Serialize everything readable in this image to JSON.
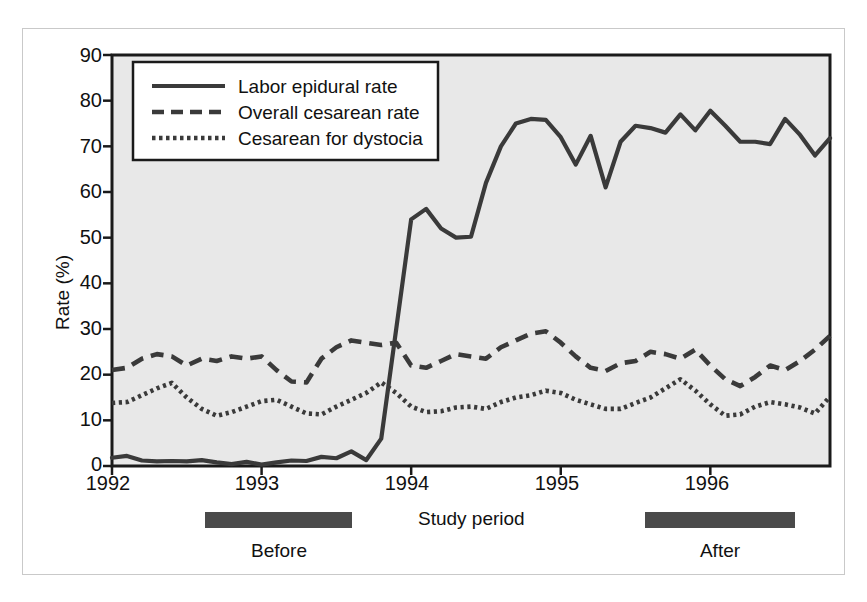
{
  "figure": {
    "background": "#ffffff",
    "plot_background": "#e8e8e8",
    "frame_color": "#c9c9c9",
    "ink_color": "#3a3a3a"
  },
  "chart_data": {
    "type": "line",
    "title": "",
    "xlabel": "Study period",
    "ylabel": "Rate (%)",
    "ylim": [
      0,
      90
    ],
    "yticks": [
      0,
      10,
      20,
      30,
      40,
      50,
      60,
      70,
      80,
      90
    ],
    "xlim": [
      1992.0,
      1996.8
    ],
    "xticks": [
      1992,
      1993,
      1994,
      1995,
      1996
    ],
    "xtick_labels": [
      "1992",
      "1993",
      "1994",
      "1995",
      "1996"
    ],
    "grid": false,
    "legend_position": "top-left inside",
    "x": [
      1992.0,
      1992.1,
      1992.2,
      1992.3,
      1992.4,
      1992.5,
      1992.6,
      1992.7,
      1992.8,
      1992.9,
      1993.0,
      1993.1,
      1993.2,
      1993.3,
      1993.4,
      1993.5,
      1993.6,
      1993.7,
      1993.8,
      1993.9,
      1994.0,
      1994.1,
      1994.2,
      1994.3,
      1994.4,
      1994.5,
      1994.6,
      1994.7,
      1994.8,
      1994.9,
      1995.0,
      1995.1,
      1995.2,
      1995.3,
      1995.4,
      1995.5,
      1995.6,
      1995.7,
      1995.8,
      1995.9,
      1996.0,
      1996.1,
      1996.2,
      1996.3,
      1996.4,
      1996.5,
      1996.6,
      1996.7,
      1996.8
    ],
    "series": [
      {
        "name": "Labor epidural rate",
        "style": "solid",
        "values": [
          1.8,
          2.2,
          1.2,
          1.0,
          1.1,
          1.0,
          1.3,
          0.8,
          0.4,
          0.9,
          0.3,
          0.8,
          1.2,
          1.1,
          2.0,
          1.7,
          3.2,
          1.3,
          6.0,
          30.0,
          54.0,
          56.3,
          52.0,
          50.0,
          50.2,
          62.0,
          70.0,
          75.0,
          76.0,
          75.8,
          72.0,
          66.0,
          72.3,
          61.0,
          71.0,
          74.5,
          74.0,
          73.0,
          77.0,
          73.5,
          77.8,
          74.5,
          71.0,
          71.0,
          70.5,
          76.0,
          72.5,
          68.0,
          71.8
        ]
      },
      {
        "name": "Overall cesarean rate",
        "style": "dashed",
        "values": [
          21.0,
          21.5,
          23.5,
          24.5,
          24.0,
          22.0,
          23.5,
          23.0,
          24.0,
          23.5,
          24.0,
          21.0,
          18.5,
          18.3,
          23.5,
          26.0,
          27.5,
          27.0,
          26.5,
          27.0,
          22.0,
          21.5,
          23.0,
          24.5,
          24.0,
          23.5,
          26.0,
          27.5,
          29.0,
          29.5,
          27.0,
          24.0,
          21.5,
          20.8,
          22.5,
          23.0,
          25.0,
          24.5,
          23.5,
          25.5,
          22.0,
          19.0,
          17.5,
          19.5,
          22.0,
          21.0,
          23.0,
          25.5,
          28.5
        ]
      },
      {
        "name": "Cesarean for dystocia",
        "style": "dotted",
        "values": [
          13.8,
          14.0,
          15.5,
          17.0,
          18.2,
          15.0,
          12.5,
          11.0,
          11.8,
          13.0,
          14.2,
          14.5,
          13.0,
          11.5,
          11.3,
          13.0,
          14.5,
          16.0,
          18.3,
          16.0,
          13.0,
          11.8,
          12.0,
          12.8,
          13.0,
          12.5,
          14.0,
          15.0,
          15.5,
          16.5,
          16.0,
          14.5,
          13.5,
          12.5,
          12.5,
          13.8,
          15.0,
          17.0,
          19.0,
          16.5,
          13.5,
          11.0,
          11.3,
          13.0,
          14.0,
          13.5,
          12.8,
          11.5,
          15.2
        ]
      }
    ]
  },
  "legend": {
    "entries": [
      {
        "label": "Labor epidural rate",
        "style": "solid"
      },
      {
        "label": "Overall cesarean rate",
        "style": "dashed"
      },
      {
        "label": "Cesarean for dystocia",
        "style": "dotted"
      }
    ]
  },
  "axis": {
    "ylabel": "Rate (%)",
    "xlabel": "Study period",
    "ytick_labels": [
      "90",
      "80",
      "70",
      "60",
      "50",
      "40",
      "30",
      "20",
      "10",
      "0"
    ],
    "xtick_labels": [
      "1992",
      "1993",
      "1994",
      "1995",
      "1996"
    ]
  },
  "period_bars": [
    {
      "label": "Before",
      "start_x": 205,
      "end_x": 352,
      "color": "#4a4a4a"
    },
    {
      "label": "After",
      "start_x": 645,
      "end_x": 795,
      "color": "#4a4a4a"
    }
  ]
}
